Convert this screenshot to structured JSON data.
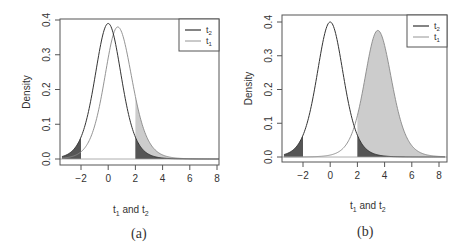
{
  "chart_data": [
    {
      "type": "line",
      "panel": "a",
      "caption": "(a)",
      "xlabel": "t1 and t2",
      "ylabel": "Density",
      "xlim": [
        -3.5,
        8.5
      ],
      "ylim": [
        0,
        0.4
      ],
      "xticks": [
        -2,
        0,
        2,
        4,
        6,
        8
      ],
      "yticks": [
        0.0,
        0.1,
        0.2,
        0.3,
        0.4
      ],
      "critical_value": 2,
      "legend": {
        "position": "topright",
        "entries": [
          "t2",
          "t1"
        ]
      },
      "series": [
        {
          "name": "t2",
          "center": 0.0,
          "peak": 0.39,
          "color": "#333333",
          "description": "central t density under null"
        },
        {
          "name": "t1",
          "center": 0.7,
          "peak": 0.38,
          "color": "#888888",
          "description": "shifted t density under alternative"
        }
      ],
      "shading": [
        {
          "region": "t2 tail x < -2",
          "color": "#555555"
        },
        {
          "region": "t2 tail x > 2",
          "color": "#555555"
        },
        {
          "region": "t1 area x > 2",
          "color": "#cccccc"
        }
      ]
    },
    {
      "type": "line",
      "panel": "b",
      "caption": "(b)",
      "xlabel": "t1 and t2",
      "ylabel": "Density",
      "xlim": [
        -3.5,
        8.5
      ],
      "ylim": [
        0,
        0.4
      ],
      "xticks": [
        -2,
        0,
        2,
        4,
        6,
        8
      ],
      "yticks": [
        0.0,
        0.1,
        0.2,
        0.3,
        0.4
      ],
      "critical_value": 2,
      "legend": {
        "position": "topright",
        "entries": [
          "t2",
          "t1"
        ]
      },
      "series": [
        {
          "name": "t2",
          "center": 0.0,
          "peak": 0.4,
          "color": "#333333",
          "description": "central t density under null"
        },
        {
          "name": "t1",
          "center": 3.5,
          "peak": 0.375,
          "color": "#888888",
          "description": "shifted t density under alternative"
        }
      ],
      "shading": [
        {
          "region": "t2 tail x < -2",
          "color": "#555555"
        },
        {
          "region": "t2 tail x > 2",
          "color": "#555555"
        },
        {
          "region": "t1 area x > 2",
          "color": "#cccccc"
        }
      ]
    }
  ],
  "panels": {
    "a": {
      "caption": "(a)",
      "ylabel": "Density",
      "legend_t2": "t",
      "legend_t2_sub": "2",
      "legend_t1": "t",
      "legend_t1_sub": "1",
      "xlabel_t1": "t",
      "xlabel_sub1": "1",
      "xlabel_and": " and ",
      "xlabel_t2": "t",
      "xlabel_sub2": "2"
    },
    "b": {
      "caption": "(b)",
      "ylabel": "Density",
      "legend_t2": "t",
      "legend_t2_sub": "2",
      "legend_t1": "t",
      "legend_t1_sub": "1",
      "xlabel_t1": "t",
      "xlabel_sub1": "1",
      "xlabel_and": " and ",
      "xlabel_t2": "t",
      "xlabel_sub2": "2"
    }
  }
}
